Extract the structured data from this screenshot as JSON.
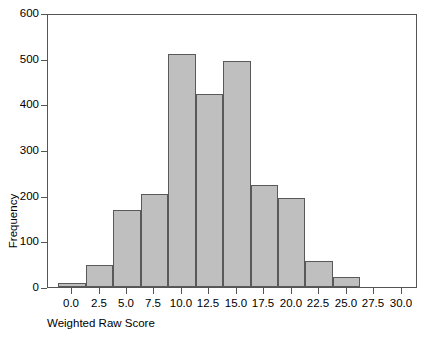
{
  "chart_data": {
    "type": "bar",
    "title": "",
    "subtitle": "",
    "xlabel": "Weighted Raw Score",
    "ylabel": "Frequency",
    "xlim": [
      -2.2,
      31.5
    ],
    "ylim": [
      0,
      600
    ],
    "grid": false,
    "legend": null,
    "bin_width": 2.5,
    "bar_color": "#bfbfbf",
    "bar_edge_color": "#595959",
    "xticks": [
      "0.0",
      "2.5",
      "5.0",
      "7.5",
      "10.0",
      "12.5",
      "15.0",
      "17.5",
      "20.0",
      "22.5",
      "25.0",
      "27.5",
      "30.0"
    ],
    "xtick_values": [
      0.0,
      2.5,
      5.0,
      7.5,
      10.0,
      12.5,
      15.0,
      17.5,
      20.0,
      22.5,
      25.0,
      27.5,
      30.0
    ],
    "yticks": [
      "0",
      "100",
      "200",
      "300",
      "400",
      "500",
      "600"
    ],
    "ytick_values": [
      0,
      100,
      200,
      300,
      400,
      500,
      600
    ],
    "bins": [
      {
        "left": -1.25,
        "right": 1.25,
        "center": 0.0,
        "value": 8
      },
      {
        "left": 1.25,
        "right": 3.75,
        "center": 2.5,
        "value": 48
      },
      {
        "left": 3.75,
        "right": 6.25,
        "center": 5.0,
        "value": 168
      },
      {
        "left": 6.25,
        "right": 8.75,
        "center": 7.5,
        "value": 204
      },
      {
        "left": 8.75,
        "right": 11.25,
        "center": 10.0,
        "value": 511
      },
      {
        "left": 11.25,
        "right": 13.75,
        "center": 12.5,
        "value": 423
      },
      {
        "left": 13.75,
        "right": 16.25,
        "center": 15.0,
        "value": 494
      },
      {
        "left": 16.25,
        "right": 18.75,
        "center": 17.5,
        "value": 223
      },
      {
        "left": 18.75,
        "right": 21.25,
        "center": 20.0,
        "value": 195
      },
      {
        "left": 21.25,
        "right": 23.75,
        "center": 22.5,
        "value": 57
      },
      {
        "left": 23.75,
        "right": 26.25,
        "center": 25.0,
        "value": 22
      }
    ],
    "categories": [
      "0.0",
      "2.5",
      "5.0",
      "7.5",
      "10.0",
      "12.5",
      "15.0",
      "17.5",
      "20.0",
      "22.5",
      "25.0"
    ],
    "values": [
      8,
      48,
      168,
      204,
      511,
      423,
      494,
      223,
      195,
      57,
      22
    ]
  }
}
